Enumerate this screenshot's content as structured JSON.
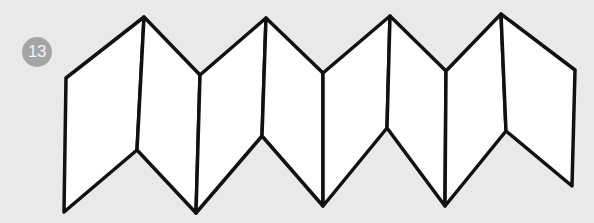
{
  "step": {
    "number": "13",
    "badge_color": "#a5a5a5"
  },
  "diagram": {
    "stroke_color": "#111111",
    "fill_color": "#ffffff",
    "background_color": "#e9e9e9",
    "panel_count": 8
  }
}
